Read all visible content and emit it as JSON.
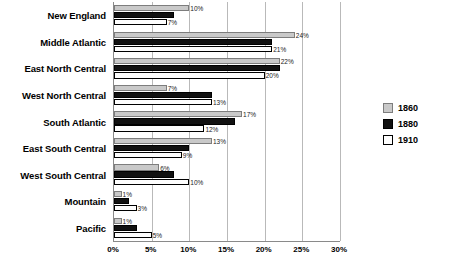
{
  "chart_data": {
    "type": "bar",
    "orientation": "horizontal",
    "title": "",
    "xlabel": "",
    "ylabel": "",
    "xlim": [
      0,
      30
    ],
    "xticks": [
      "0%",
      "5%",
      "10%",
      "15%",
      "20%",
      "25%",
      "30%"
    ],
    "xtick_values": [
      0,
      5,
      10,
      15,
      20,
      25,
      30
    ],
    "grid": true,
    "legend_position": "right",
    "categories": [
      "New England",
      "Middle Atlantic",
      "East North Central",
      "West North Central",
      "South Atlantic",
      "East South Central",
      "West South Central",
      "Mountain",
      "Pacific"
    ],
    "series": [
      {
        "name": "1860",
        "color": "#c9c9c9",
        "values": [
          10,
          24,
          22,
          7,
          17,
          13,
          6,
          1,
          1
        ],
        "labels": [
          "10%",
          "24%",
          "22%",
          "7%",
          "17%",
          "13%",
          "6%",
          "1%",
          "1%"
        ]
      },
      {
        "name": "1880",
        "color": "#111111",
        "values": [
          8,
          21,
          22,
          13,
          16,
          10,
          8,
          2,
          3
        ],
        "labels": [
          "",
          "",
          "",
          "",
          "",
          "",
          "",
          "",
          ""
        ]
      },
      {
        "name": "1910",
        "color": "#fdfdfd",
        "values": [
          7,
          21,
          20,
          13,
          12,
          9,
          10,
          3,
          5
        ],
        "labels": [
          "7%",
          "21%",
          "20%",
          "13%",
          "12%",
          "9%",
          "10%",
          "3%",
          "5%"
        ]
      }
    ]
  },
  "legend": {
    "items": [
      {
        "label": "1860"
      },
      {
        "label": "1880"
      },
      {
        "label": "1910"
      }
    ]
  }
}
